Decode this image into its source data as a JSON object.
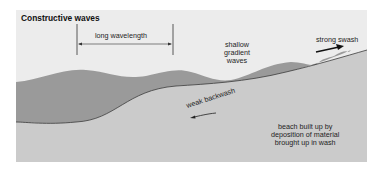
{
  "title": "Constructive waves",
  "labels": {
    "wavelength": "long wavelength",
    "shallow": "shallow\ngradient\nwaves",
    "swash": "strong swash",
    "backwash": "weak backwash",
    "beach": "beach built up by\ndeposition of material\nbrought up in wash"
  },
  "colors": {
    "background": "#ececec",
    "water": "#9a9a9a",
    "beach": "#cbcbcb",
    "line": "#3a3a3a",
    "arrow": "#111111"
  }
}
